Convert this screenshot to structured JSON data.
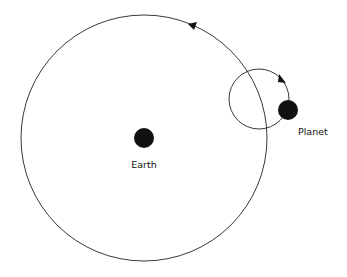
{
  "diagram": {
    "type": "epicycle",
    "labels": {
      "earth": "Earth",
      "planet": "Planet"
    },
    "colors": {
      "stroke": "#222222",
      "body": "#111111",
      "background": "#ffffff"
    }
  }
}
